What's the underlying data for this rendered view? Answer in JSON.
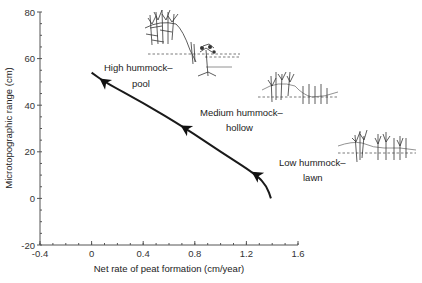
{
  "chart_data": {
    "type": "line",
    "title": "",
    "xlabel": "Net rate of peat formation (cm/year)",
    "ylabel": "Microtopographic range (cm)",
    "xlim": [
      -0.4,
      1.6
    ],
    "ylim": [
      -20,
      80
    ],
    "x_ticks": [
      "-0.4",
      "0",
      "0.4",
      "0.8",
      "1.2",
      "1.6"
    ],
    "y_ticks": [
      "-20",
      "0",
      "20",
      "40",
      "60",
      "80"
    ],
    "grid": false,
    "legend": null,
    "series": [
      {
        "name": "Microtopography development trajectory",
        "x": [
          0.0,
          0.1,
          0.4,
          0.73,
          1.0,
          1.28,
          1.36,
          1.39
        ],
        "y": [
          54,
          50,
          41,
          30,
          20,
          10,
          5,
          0
        ]
      }
    ],
    "markers": [
      {
        "label": "High hummock–pool",
        "x": 0.1,
        "y": 50
      },
      {
        "label": "Medium hummock–hollow",
        "x": 0.73,
        "y": 30
      },
      {
        "label": "Low hummock–lawn",
        "x": 1.28,
        "y": 10
      }
    ],
    "annotations": [
      {
        "line1": "High hummock–",
        "line2": "pool"
      },
      {
        "line1": "Medium hummock–",
        "line2": "hollow"
      },
      {
        "line1": "Low hummock–",
        "line2": "lawn"
      }
    ],
    "illustrations": [
      "high-hummock-pool-vegetation-sketch",
      "medium-hummock-hollow-vegetation-sketch",
      "low-hummock-lawn-vegetation-sketch"
    ]
  }
}
